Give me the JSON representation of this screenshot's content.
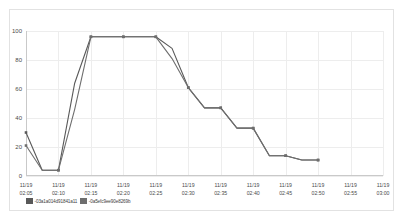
{
  "chart_data": {
    "type": "line",
    "title": "",
    "xlabel": "",
    "ylabel": "",
    "ylim": [
      0,
      100
    ],
    "yticks": [
      0,
      20,
      40,
      60,
      80,
      100
    ],
    "grid": true,
    "legend_position": "bottom-left",
    "date_label": "11/19",
    "categories": [
      "02:05",
      "02:07",
      "02:10",
      "02:12",
      "02:15",
      "02:17",
      "02:20",
      "02:22",
      "02:25",
      "02:27",
      "02:30",
      "02:32",
      "02:35",
      "02:37",
      "02:40",
      "02:42",
      "02:45",
      "02:47",
      "02:50"
    ],
    "xtick_labels": [
      "02:05",
      "02:10",
      "02:15",
      "02:20",
      "02:25",
      "02:30",
      "02:35",
      "02:40",
      "02:45",
      "02:50",
      "02:55",
      "03:00"
    ],
    "series": [
      {
        "name": "03a1a014d91841a11",
        "color": "#595959",
        "values": [
          30,
          4,
          4,
          64,
          96,
          96,
          96,
          96,
          96,
          88,
          61,
          47,
          47,
          33,
          33,
          14,
          14,
          11,
          11
        ]
      },
      {
        "name": "0a5efc9ee90e8269b",
        "color": "#6e6e6e",
        "values": [
          21,
          4,
          4,
          46,
          96,
          96,
          96,
          96,
          96,
          81,
          61,
          47,
          47,
          33,
          33,
          14,
          14,
          11,
          11
        ]
      }
    ]
  },
  "legend": {
    "entries": [
      {
        "label": "-03a1a014d91841a11",
        "color": "#595959"
      },
      {
        "label": "-0a5efc9ee90e8269b",
        "color": "#6e6e6e"
      }
    ]
  }
}
